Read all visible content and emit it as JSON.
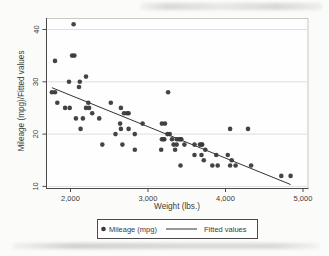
{
  "chart_data": {
    "type": "scatter",
    "title": "",
    "xlabel": "Weight (lbs.)",
    "ylabel": "Mileage (mpg)/Fitted values",
    "xlim": [
      1690,
      5065
    ],
    "ylim": [
      9.6,
      42.1
    ],
    "xticks": [
      {
        "v": 2000,
        "label": "2,000"
      },
      {
        "v": 3000,
        "label": "3,000"
      },
      {
        "v": 4000,
        "label": "4,000"
      },
      {
        "v": 5000,
        "label": "5,000"
      }
    ],
    "yticks": [
      {
        "v": 10,
        "label": "10"
      },
      {
        "v": 20,
        "label": "20"
      },
      {
        "v": 30,
        "label": "30"
      },
      {
        "v": 40,
        "label": "40"
      }
    ],
    "grid": "horizontal-y-gridlines",
    "legend_position": "bottom-center-boxed",
    "series": [
      {
        "name": "Mileage (mpg)",
        "type": "scatter",
        "marker": "filled-circle",
        "color": "#3a3a3a",
        "points": [
          [
            2930,
            22
          ],
          [
            3350,
            17
          ],
          [
            2640,
            22
          ],
          [
            3250,
            20
          ],
          [
            4080,
            15
          ],
          [
            3670,
            18
          ],
          [
            2230,
            26
          ],
          [
            3280,
            20
          ],
          [
            3880,
            16
          ],
          [
            3400,
            19
          ],
          [
            4330,
            14
          ],
          [
            3900,
            14
          ],
          [
            4290,
            21
          ],
          [
            2110,
            29
          ],
          [
            3690,
            16
          ],
          [
            3180,
            22
          ],
          [
            3220,
            22
          ],
          [
            2750,
            24
          ],
          [
            3430,
            19
          ],
          [
            2120,
            30
          ],
          [
            3600,
            18
          ],
          [
            3600,
            16
          ],
          [
            3740,
            17
          ],
          [
            1800,
            28
          ],
          [
            2650,
            21
          ],
          [
            4840,
            12
          ],
          [
            4720,
            12
          ],
          [
            3830,
            14
          ],
          [
            2580,
            20
          ],
          [
            4060,
            14
          ],
          [
            3720,
            15
          ],
          [
            3370,
            18
          ],
          [
            4130,
            14
          ],
          [
            2830,
            20
          ],
          [
            4060,
            21
          ],
          [
            3310,
            19
          ],
          [
            3180,
            19
          ],
          [
            3690,
            18
          ],
          [
            3370,
            19
          ],
          [
            2730,
            24
          ],
          [
            4030,
            16
          ],
          [
            3260,
            28
          ],
          [
            1800,
            34
          ],
          [
            2200,
            25
          ],
          [
            2520,
            26
          ],
          [
            3330,
            18
          ],
          [
            3700,
            18
          ],
          [
            3470,
            18
          ],
          [
            3210,
            19
          ],
          [
            3200,
            19
          ],
          [
            3420,
            19
          ],
          [
            2690,
            24
          ],
          [
            2830,
            17
          ],
          [
            2070,
            23
          ],
          [
            2650,
            25
          ],
          [
            2370,
            23
          ],
          [
            2020,
            35
          ],
          [
            2280,
            24
          ],
          [
            2750,
            21
          ],
          [
            2130,
            21
          ],
          [
            2240,
            25
          ],
          [
            1760,
            28
          ],
          [
            1980,
            30
          ],
          [
            3420,
            14
          ],
          [
            1830,
            26
          ],
          [
            2050,
            35
          ],
          [
            2410,
            18
          ],
          [
            2200,
            31
          ],
          [
            2670,
            18
          ],
          [
            2160,
            23
          ],
          [
            2040,
            41
          ],
          [
            1930,
            25
          ],
          [
            1990,
            25
          ],
          [
            3170,
            17
          ]
        ]
      },
      {
        "name": "Fitted values",
        "type": "line",
        "color": "#333333",
        "points": [
          [
            1760,
            28.87
          ],
          [
            4840,
            10.36
          ]
        ]
      }
    ]
  },
  "colors": {
    "page_background": "#fbfbf9",
    "plot_background": "#fefefe",
    "plot_border": "#c9c9c4",
    "axis": "#4a4a4a",
    "grid": "#dededa",
    "point": "#3a3a3a",
    "line": "#333333",
    "text": "#3a3a3a"
  }
}
